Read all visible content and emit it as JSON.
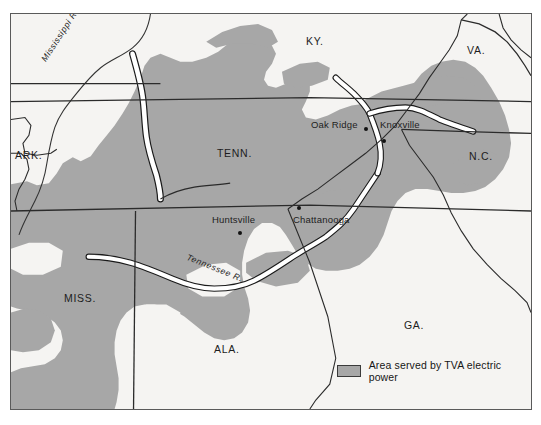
{
  "map": {
    "title": "Area served by TVA electric power",
    "colors": {
      "served_area_fill": "#a7a7a7",
      "background": "#f5f4f2",
      "border_line": "#2b2b2b",
      "frame": "#5a5a5a",
      "water": "#ffffff",
      "text": "#1d1d1d"
    },
    "states": [
      {
        "name": "ARK.",
        "x": 14,
        "y": 148
      },
      {
        "name": "MISS.",
        "x": 63,
        "y": 291
      },
      {
        "name": "TENN.",
        "x": 216,
        "y": 146
      },
      {
        "name": "ALA.",
        "x": 213,
        "y": 342
      },
      {
        "name": "KY.",
        "x": 305,
        "y": 34
      },
      {
        "name": "GA.",
        "x": 403,
        "y": 318
      },
      {
        "name": "N.C.",
        "x": 468,
        "y": 149
      },
      {
        "name": "VA.",
        "x": 466,
        "y": 43
      }
    ],
    "cities": [
      {
        "name": "Oak Ridge",
        "label_x": 310,
        "label_y": 119,
        "dot_x": 363,
        "dot_y": 127
      },
      {
        "name": "Knoxville",
        "label_x": 379,
        "label_y": 119,
        "dot_x": 381,
        "dot_y": 139
      },
      {
        "name": "Huntsville",
        "label_x": 211,
        "label_y": 214,
        "dot_x": 237,
        "dot_y": 231
      },
      {
        "name": "Chattanooga",
        "label_x": 292,
        "label_y": 214,
        "dot_x": 296,
        "dot_y": 208
      }
    ],
    "rivers": [
      {
        "name": "Mississippi R.",
        "x": 38,
        "y": 56,
        "rotate": -57
      },
      {
        "name": "Tennessee R.",
        "x": 188,
        "y": 250,
        "rotate": 22
      }
    ],
    "legend": {
      "label": "Area served by TVA electric power",
      "swatch_color": "#a7a7a7"
    }
  }
}
